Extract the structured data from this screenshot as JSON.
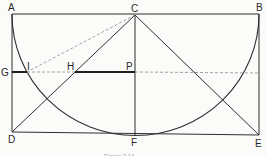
{
  "diagram": {
    "type": "geometric-construction",
    "colors": {
      "stroke": "#2f2f2f",
      "dashed": "#8a8a8a",
      "background": "#fbfbf9"
    },
    "labels": {
      "A": "A",
      "B": "B",
      "C": "C",
      "D": "D",
      "E": "E",
      "F": "F",
      "G": "G",
      "H": "H",
      "I": "I",
      "P": "P"
    },
    "points": {
      "A": [
        12,
        14
      ],
      "B": [
        259,
        14
      ],
      "C": [
        135,
        15
      ],
      "D": [
        12,
        132
      ],
      "E": [
        259,
        135
      ],
      "F": [
        135,
        135
      ],
      "G": [
        12,
        72
      ],
      "I": [
        27,
        72
      ],
      "H": [
        75,
        72
      ],
      "P": [
        135,
        72
      ]
    },
    "caption": "Figure 3.14"
  }
}
